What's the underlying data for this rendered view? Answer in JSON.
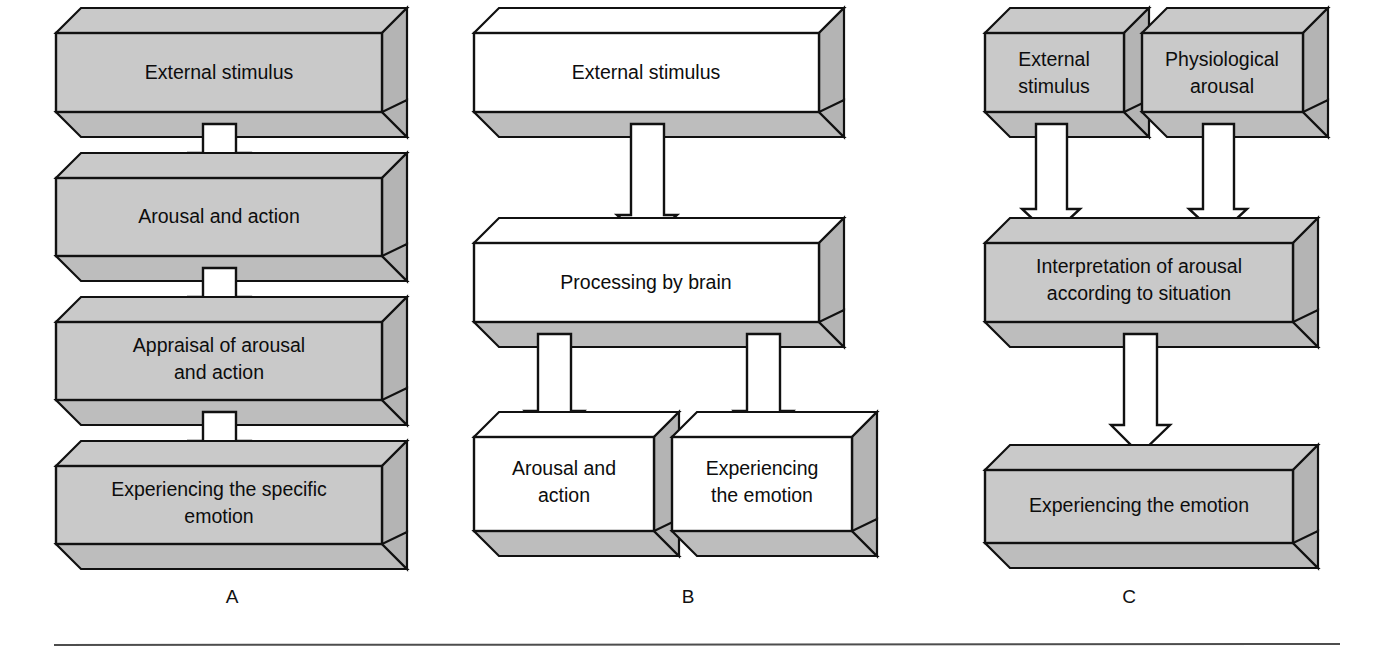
{
  "figure": {
    "background_color": "#ffffff",
    "ink_color": "#111111",
    "gray_face_color": "#c9c9c9",
    "gray_side_color": "#b4b4b4",
    "gray_bottom_color": "#bdbdbd",
    "white_face_color": "#ffffff",
    "arrow_fill": "#ffffff",
    "rule_color": "#4d4d4d"
  },
  "panels": [
    {
      "letter": "A",
      "style": "filled",
      "boxes": [
        {
          "id": "a-external-stimulus",
          "lines": [
            "External stimulus"
          ]
        },
        {
          "id": "a-arousal-and-action",
          "lines": [
            "Arousal and action"
          ]
        },
        {
          "id": "a-appraisal",
          "lines": [
            "Appraisal of arousal",
            "and action"
          ]
        },
        {
          "id": "a-experiencing",
          "lines": [
            "Experiencing the specific",
            "emotion"
          ]
        }
      ],
      "arrows": 3
    },
    {
      "letter": "B",
      "style": "outline",
      "boxes": [
        {
          "id": "b-external-stimulus",
          "lines": [
            "External stimulus"
          ]
        },
        {
          "id": "b-processing-by-brain",
          "lines": [
            "Processing by brain"
          ]
        },
        {
          "id": "b-arousal-and-action",
          "lines": [
            "Arousal and",
            "action"
          ]
        },
        {
          "id": "b-experiencing",
          "lines": [
            "Experiencing",
            "the emotion"
          ]
        }
      ],
      "arrows": 3
    },
    {
      "letter": "C",
      "style": "filled",
      "boxes": [
        {
          "id": "c-external-stimulus",
          "lines": [
            "External",
            "stimulus"
          ]
        },
        {
          "id": "c-physiological-arousal",
          "lines": [
            "Physiological",
            "arousal"
          ]
        },
        {
          "id": "c-interpretation",
          "lines": [
            "Interpretation of arousal",
            "according to situation"
          ]
        },
        {
          "id": "c-experiencing",
          "lines": [
            "Experiencing the emotion"
          ]
        }
      ],
      "arrows": 3
    }
  ],
  "panel_letters": {
    "a": "A",
    "b": "B",
    "c": "C"
  },
  "box_text": {
    "a0": "External stimulus",
    "a1": "Arousal and action",
    "a2_l1": "Appraisal of arousal",
    "a2_l2": "and action",
    "a3_l1": "Experiencing the specific",
    "a3_l2": "emotion",
    "b0": "External stimulus",
    "b1": "Processing by brain",
    "b2_l1": "Arousal and",
    "b2_l2": "action",
    "b3_l1": "Experiencing",
    "b3_l2": "the emotion",
    "c0_l1": "External",
    "c0_l2": "stimulus",
    "c1_l1": "Physiological",
    "c1_l2": "arousal",
    "c2_l1": "Interpretation of arousal",
    "c2_l2": "according to situation",
    "c3": "Experiencing the emotion"
  }
}
